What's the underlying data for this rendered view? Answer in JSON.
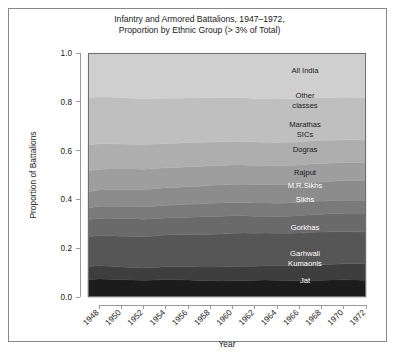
{
  "chart_data": {
    "type": "area",
    "title": "Infantry and Armored Battalions, 1947–1972,\nProportion by Ethnic Group (> 3% of Total)",
    "xlabel": "Year",
    "ylabel": "Proportion of Battalions",
    "stacked": true,
    "normalized": true,
    "grid": false,
    "legend_position": "inline-right-labels",
    "xlim": [
      1947,
      1972
    ],
    "ylim": [
      0.0,
      1.0
    ],
    "x_tick_labels": [
      "1948",
      "1950",
      "1952",
      "1954",
      "1956",
      "1958",
      "1960",
      "1962",
      "1964",
      "1966",
      "1968",
      "1970",
      "1972"
    ],
    "x_ticks": [
      1948,
      1950,
      1952,
      1954,
      1956,
      1958,
      1960,
      1962,
      1964,
      1966,
      1968,
      1970,
      1972
    ],
    "y_tick_labels": [
      "0.0",
      "0.2",
      "0.4",
      "0.6",
      "0.8",
      "1.0"
    ],
    "y_ticks": [
      0.0,
      0.2,
      0.4,
      0.6,
      0.8,
      1.0
    ],
    "x": [
      1947,
      1948,
      1949,
      1950,
      1951,
      1952,
      1953,
      1954,
      1955,
      1956,
      1957,
      1958,
      1959,
      1960,
      1961,
      1962,
      1963,
      1964,
      1965,
      1966,
      1967,
      1968,
      1969,
      1970,
      1971,
      1972
    ],
    "series": [
      {
        "name": "Jat",
        "color": "#1c1c1c",
        "label_color": "#ffffff",
        "values": [
          0.072,
          0.074,
          0.073,
          0.071,
          0.07,
          0.069,
          0.07,
          0.072,
          0.071,
          0.07,
          0.068,
          0.067,
          0.066,
          0.067,
          0.068,
          0.069,
          0.07,
          0.069,
          0.068,
          0.067,
          0.068,
          0.069,
          0.07,
          0.071,
          0.07,
          0.069
        ]
      },
      {
        "name": "Garhwali\nKumaonis",
        "color": "#3e3e3e",
        "label_color": "#ffffff",
        "values": [
          0.053,
          0.054,
          0.053,
          0.052,
          0.051,
          0.05,
          0.051,
          0.052,
          0.053,
          0.054,
          0.055,
          0.056,
          0.057,
          0.058,
          0.058,
          0.057,
          0.058,
          0.059,
          0.06,
          0.061,
          0.062,
          0.063,
          0.064,
          0.065,
          0.066,
          0.067
        ]
      },
      {
        "name": "Gorkhas",
        "color": "#565656",
        "label_color": "#ffffff",
        "values": [
          0.122,
          0.124,
          0.125,
          0.126,
          0.127,
          0.128,
          0.129,
          0.13,
          0.131,
          0.132,
          0.133,
          0.134,
          0.135,
          0.136,
          0.136,
          0.135,
          0.134,
          0.133,
          0.133,
          0.134,
          0.135,
          0.134,
          0.133,
          0.132,
          0.131,
          0.13
        ]
      },
      {
        "name": "Sikhs",
        "color": "#6a6a6a",
        "label_color": "#ffffff",
        "values": [
          0.07,
          0.071,
          0.072,
          0.073,
          0.073,
          0.072,
          0.071,
          0.07,
          0.07,
          0.071,
          0.072,
          0.073,
          0.073,
          0.072,
          0.071,
          0.07,
          0.069,
          0.069,
          0.07,
          0.071,
          0.072,
          0.073,
          0.074,
          0.075,
          0.076,
          0.077
        ]
      },
      {
        "name": "M.R.Sikhs",
        "color": "#7a7a7a",
        "label_color": "#ffffff",
        "values": [
          0.048,
          0.049,
          0.049,
          0.05,
          0.05,
          0.051,
          0.051,
          0.052,
          0.052,
          0.053,
          0.053,
          0.054,
          0.054,
          0.054,
          0.054,
          0.054,
          0.054,
          0.054,
          0.054,
          0.054,
          0.054,
          0.054,
          0.054,
          0.054,
          0.054,
          0.054
        ]
      },
      {
        "name": "Rajput",
        "color": "#8c8c8c",
        "label_color": "#1a1a1a",
        "values": [
          0.066,
          0.067,
          0.068,
          0.069,
          0.07,
          0.071,
          0.072,
          0.072,
          0.072,
          0.073,
          0.073,
          0.074,
          0.074,
          0.075,
          0.075,
          0.076,
          0.076,
          0.077,
          0.077,
          0.078,
          0.078,
          0.079,
          0.079,
          0.08,
          0.08,
          0.081
        ]
      },
      {
        "name": "Dogras",
        "color": "#9e9e9e",
        "label_color": "#1a1a1a",
        "values": [
          0.086,
          0.085,
          0.085,
          0.084,
          0.084,
          0.083,
          0.083,
          0.082,
          0.082,
          0.081,
          0.081,
          0.08,
          0.08,
          0.079,
          0.079,
          0.078,
          0.078,
          0.077,
          0.077,
          0.076,
          0.076,
          0.075,
          0.075,
          0.074,
          0.074,
          0.073
        ]
      },
      {
        "name": "Marathas\nSICs",
        "color": "#aeaeae",
        "label_color": "#1a1a1a",
        "values": [
          0.105,
          0.104,
          0.103,
          0.102,
          0.101,
          0.1,
          0.1,
          0.099,
          0.099,
          0.098,
          0.098,
          0.097,
          0.097,
          0.096,
          0.096,
          0.096,
          0.095,
          0.095,
          0.095,
          0.094,
          0.094,
          0.094,
          0.093,
          0.093,
          0.093,
          0.092
        ]
      },
      {
        "name": "Other\nclasses",
        "color": "#bfbfbf",
        "label_color": "#1a1a1a",
        "values": [
          0.195,
          0.193,
          0.192,
          0.19,
          0.189,
          0.188,
          0.187,
          0.186,
          0.185,
          0.184,
          0.183,
          0.182,
          0.181,
          0.18,
          0.18,
          0.179,
          0.179,
          0.178,
          0.178,
          0.177,
          0.177,
          0.176,
          0.176,
          0.175,
          0.175,
          0.174
        ]
      },
      {
        "name": "All India",
        "color": "#cfcfcf",
        "label_color": "#1a1a1a",
        "values": [
          0.183,
          0.179,
          0.18,
          0.183,
          0.185,
          0.188,
          0.186,
          0.185,
          0.185,
          0.184,
          0.184,
          0.183,
          0.183,
          0.183,
          0.183,
          0.186,
          0.187,
          0.189,
          0.188,
          0.188,
          0.184,
          0.183,
          0.182,
          0.181,
          0.181,
          0.183
        ]
      }
    ]
  }
}
